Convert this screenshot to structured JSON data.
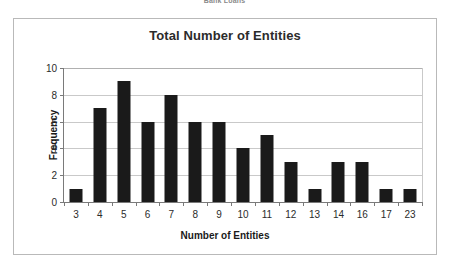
{
  "page": {
    "header_text": "Bank Loans"
  },
  "chart_data": {
    "type": "bar",
    "title": "Total Number of Entities",
    "xlabel": "Number of Entities",
    "ylabel": "Frequency",
    "categories": [
      "3",
      "4",
      "5",
      "6",
      "7",
      "8",
      "9",
      "10",
      "11",
      "12",
      "13",
      "14",
      "16",
      "17",
      "23"
    ],
    "values": [
      1,
      7,
      9,
      6,
      8,
      6,
      6,
      4,
      5,
      3,
      1,
      3,
      3,
      1,
      1
    ],
    "ylim": [
      0,
      10
    ],
    "y_ticks": [
      "0",
      "2",
      "4",
      "6",
      "8",
      "10"
    ],
    "grid": true,
    "legend": false,
    "bar_color": "#1a1a1a",
    "grid_color": "#c9c9c9",
    "axis_color": "#7a7a7a",
    "frame_color": "#b9b9b9",
    "background": "#ffffff"
  }
}
